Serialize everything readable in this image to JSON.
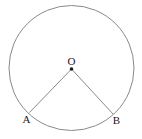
{
  "figure": {
    "kind": "circle-central-angle-diagram",
    "background_color": "#ffffff",
    "stroke_color": "#6b6b6b",
    "label_color": "#1a1a1a",
    "stroke_width": 0.8,
    "canvas": {
      "width": 142,
      "height": 139
    }
  },
  "circle": {
    "center_x": 71.5,
    "center_y": 68,
    "radius": 62.5
  },
  "center_point": {
    "label": "O",
    "x": 71.5,
    "y": 69,
    "dot_radius": 1.8,
    "label_x": 71.5,
    "label_y": 64.5
  },
  "points": [
    {
      "label": "A",
      "x": 29.5,
      "y": 112.5,
      "label_x": 26.5,
      "label_y": 122.5
    },
    {
      "label": "B",
      "x": 113,
      "y": 114,
      "label_x": 116.5,
      "label_y": 124
    }
  ],
  "radii": [
    {
      "name": "radius-OA",
      "from": "O",
      "to": "A",
      "x1": 71.5,
      "y1": 69,
      "x2": 29.5,
      "y2": 112.5
    },
    {
      "name": "radius-OB",
      "from": "O",
      "to": "B",
      "x1": 71.5,
      "y1": 69,
      "x2": 113,
      "y2": 114
    }
  ]
}
